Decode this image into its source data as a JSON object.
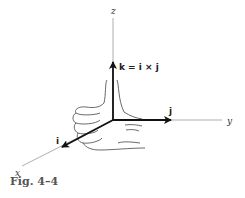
{
  "figure": {
    "caption": "Fig. 4–4",
    "axes": {
      "x": "x",
      "y": "y",
      "z": "z"
    },
    "vectors": {
      "i": "i",
      "j": "j",
      "k": "k = i × j"
    },
    "illustration": "right-hand-rule-hand",
    "colors": {
      "axis": "#888888",
      "vector": "#111111",
      "caption": "#555555"
    }
  }
}
